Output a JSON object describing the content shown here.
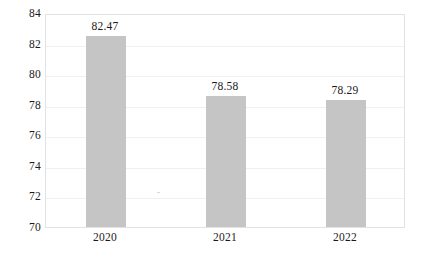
{
  "chart_data": {
    "type": "bar",
    "title": "",
    "subtitle": "",
    "xlabel": "",
    "ylabel": "",
    "categories": [
      "2020",
      "2021",
      "2022"
    ],
    "values": [
      82.47,
      78.58,
      78.29
    ],
    "value_labels": [
      "82.47",
      "78.58",
      "78.29"
    ],
    "series": [
      {
        "name": "",
        "values": [
          82.47,
          78.58,
          78.29
        ]
      }
    ],
    "ylim": [
      70,
      84
    ],
    "yticks": [
      84,
      82,
      80,
      78,
      76,
      74,
      72,
      70
    ],
    "ytick_labels": [
      "84",
      "82",
      "80",
      "78",
      "76",
      "74",
      "72",
      "70"
    ],
    "grid": true,
    "grid_axis": "y",
    "legend": false,
    "legend_position": "none",
    "annotations": [],
    "colors": {
      "bar_fill": "#c5c5c5",
      "plot_border": "#e2e2e2",
      "gridline": "#f0f0f0",
      "text": "#1a1a1a",
      "background": "#ffffff"
    }
  }
}
